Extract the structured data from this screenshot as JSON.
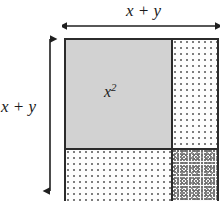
{
  "figure": {
    "kind": "algebra-tiles-area-model",
    "labels": {
      "top_dimension": "x + y",
      "left_dimension": "x + y",
      "area_x_squared_base": "x",
      "area_x_squared_exponent": "2"
    },
    "arrows": {
      "top": {
        "name": "horizontal-dimension-arrow",
        "orientation": "horizontal",
        "heads": "both"
      },
      "left": {
        "name": "vertical-dimension-arrow",
        "orientation": "vertical",
        "heads": "both"
      }
    },
    "regions": [
      {
        "id": "x-squared",
        "position": "top-left",
        "fill": "solid-gray",
        "color": "#d2d2d2",
        "label": "x²"
      },
      {
        "id": "xy-top-right",
        "position": "top-right",
        "fill": "sparse-dotted",
        "color": "#7e7e7e",
        "label": ""
      },
      {
        "id": "xy-bottom-left",
        "position": "bottom-left",
        "fill": "sparse-dotted",
        "color": "#7e7e7e",
        "label": ""
      },
      {
        "id": "y-squared",
        "position": "bottom-right",
        "fill": "dense-speckled",
        "color": "#6f6f6f",
        "label": ""
      }
    ],
    "colors": {
      "stroke": "#2b2b2b",
      "background": "#ffffff",
      "text": "#1a1a1a"
    }
  }
}
